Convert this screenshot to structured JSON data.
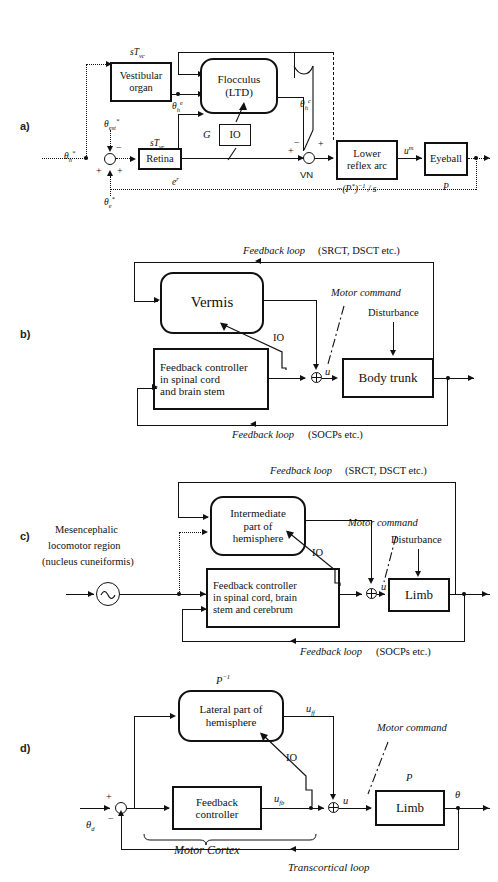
{
  "figure": {
    "type": "block-diagram-set",
    "panels": [
      "a)",
      "b)",
      "c)",
      "d)"
    ]
  },
  "panel_a": {
    "letter": "a)",
    "blocks": {
      "vestibular": "Vestibular\norgan",
      "vestibular_l1": "Vestibular",
      "vestibular_l2": "organ",
      "flocculus_l1": "Flocculus",
      "flocculus_l2": "(LTD)",
      "retina": "Retina",
      "io": "IO",
      "lower_l1": "Lower",
      "lower_l2": "reflex arc",
      "eyeball": "Eyeball"
    },
    "labels": {
      "sT_vc": "sT",
      "sT_vc_sub": "vc",
      "sT_vr": "sT",
      "sT_vr_sub": "vr",
      "gain_G": "G",
      "vn": "VN",
      "theta_head_in": "θ",
      "theta_head_in_sub": "h",
      "theta_head_in_sup": "*",
      "theta_est": "θ",
      "theta_est_sub": "est",
      "theta_est_sup": "*",
      "theta_e": "θ",
      "theta_e_sub": "e",
      "theta_e_sup": "*",
      "theta_dot_h_e": "θ",
      "theta_dot_h_e_sub": "h",
      "theta_dot_h_e_sup": "e",
      "theta_dot_h_c": "θ",
      "theta_dot_h_c_sub": "h",
      "theta_dot_h_c_sup": "c",
      "e_r": "e",
      "e_r_sup": "r",
      "u_m": "u",
      "u_m_sup": "m",
      "plant_inv": "−(P",
      "plant_inv_sup": "*",
      "plant_inv_tail": ")",
      "plant_inv_exp": "−1",
      "plant_inv_s": " / s",
      "plant_P": "P",
      "sign_minus": "−",
      "sign_plus": "+"
    }
  },
  "panel_b": {
    "letter": "b)",
    "blocks": {
      "vermis": "Vermis",
      "feedback_l1": "Feedback controller",
      "feedback_l2": "in spinal cord",
      "feedback_l3": "and brain stem",
      "body_trunk": "Body trunk"
    },
    "labels": {
      "fb_top_it": "Feedback loop",
      "fb_top_rest": "(SRCT, DSCT etc.)",
      "fb_bottom_it": "Feedback loop",
      "fb_bottom_rest": "(SOCPs etc.)",
      "motor_command": "Motor command",
      "disturbance": "Disturbance",
      "io": "IO",
      "u": "u"
    }
  },
  "panel_c": {
    "letter": "c)",
    "blocks": {
      "hemisphere_l1": "Intermediate",
      "hemisphere_l2": "part of",
      "hemisphere_l3": "hemisphere",
      "feedback_l1": "Feedback controller",
      "feedback_l2": "in spinal cord, brain",
      "feedback_l3": "stem and cerebrum",
      "limb": "Limb"
    },
    "labels": {
      "mlr_l1": "Mesencephalic",
      "mlr_l2": "locomotor region",
      "mlr_l3": "(nucleus cuneiformis)",
      "fb_top_it": "Feedback loop",
      "fb_top_rest": "(SRCT, DSCT etc.)",
      "fb_bottom_it": "Feedback loop",
      "fb_bottom_rest": "(SOCPs  etc.)",
      "motor_command": "Motor command",
      "disturbance": "Disturbance",
      "io": "IO",
      "u": "u"
    }
  },
  "panel_d": {
    "letter": "d)",
    "blocks": {
      "lateral_l1": "Lateral part of",
      "lateral_l2": "hemisphere",
      "feedback_l1": "Feedback",
      "feedback_l2": "controller",
      "limb": "Limb"
    },
    "labels": {
      "p_inv": "P",
      "p_inv_exp": "−1",
      "plant_P": "P",
      "u_ff": "u",
      "u_ff_sub": "ff",
      "u_fb": "u",
      "u_fb_sub": "fb",
      "u": "u",
      "theta_d": "θ",
      "theta_d_sub": "d",
      "theta_out": "θ",
      "motor_command": "Motor command",
      "motor_cortex": "Motor Cortex",
      "transcortical": "Transcortical loop",
      "io": "IO",
      "sign_plus": "+",
      "sign_minus": "−"
    }
  },
  "colors": {
    "ink": "#111111",
    "paper": "#ffffff"
  }
}
